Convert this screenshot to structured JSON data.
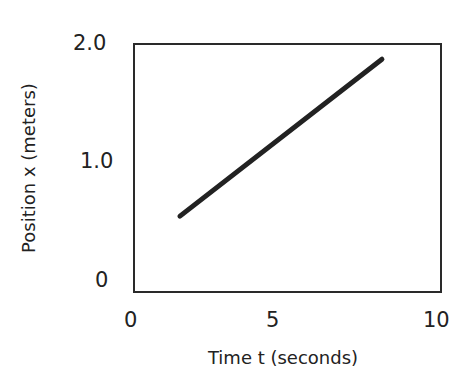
{
  "chart_data": {
    "type": "line",
    "title": "",
    "xlabel": "Time t (seconds)",
    "ylabel": "Position x (meters)",
    "xlim": [
      0,
      10
    ],
    "ylim": [
      0,
      2.0
    ],
    "x_ticks": [
      "0",
      "5",
      "10"
    ],
    "y_ticks": [
      "0",
      "1.0",
      "2.0"
    ],
    "grid": false,
    "legend": null,
    "series": [
      {
        "name": "position",
        "x": [
          1.6,
          8.2
        ],
        "y": [
          0.55,
          1.88
        ],
        "color": "#222222"
      }
    ]
  },
  "axes": {
    "x_tick_labels": [
      "0",
      "5",
      "10"
    ],
    "y_tick_labels": [
      "2.0",
      "1.0",
      "0"
    ],
    "xlabel": "Time t (seconds)",
    "ylabel": "Position x (meters)"
  }
}
